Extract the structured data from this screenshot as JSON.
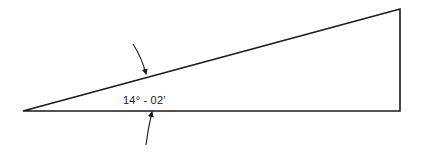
{
  "diagram": {
    "type": "right-triangle",
    "angle_label": "14° - 02′",
    "stroke_color": "#1a1a1a",
    "background": "#ffffff",
    "vertices": {
      "apex": [
        23,
        111
      ],
      "top_right": [
        400,
        9
      ],
      "bottom_right": [
        400,
        111
      ]
    },
    "annotations": [
      {
        "kind": "dimension-arrow",
        "direction": "down",
        "target": "hypotenuse"
      },
      {
        "kind": "dimension-arrow",
        "direction": "up",
        "target": "base"
      }
    ]
  }
}
